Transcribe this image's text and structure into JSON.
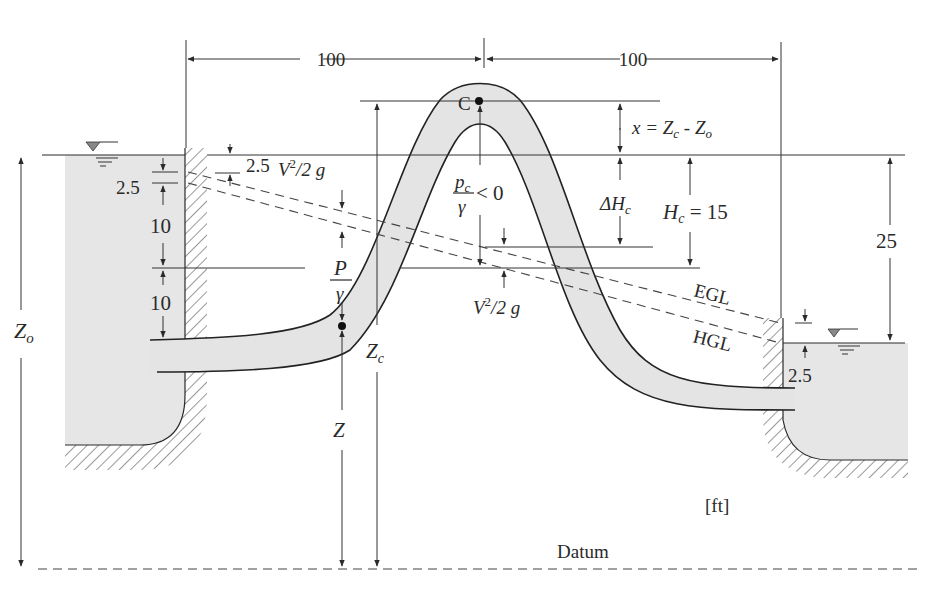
{
  "diagram": {
    "units": "[ft]",
    "datum_label": "Datum",
    "horizontal_dims": {
      "left_span": "100",
      "right_span": "100"
    },
    "crest": {
      "point_label": "C",
      "x_eq_lhs": "x = Z",
      "x_eq_sub1": "c",
      "x_eq_mid": " - Z",
      "x_eq_sub2": "o",
      "pressure_num": "p",
      "pressure_num_sub": "c",
      "pressure_den": "γ",
      "pressure_cond": "< 0",
      "delta_h": "ΔH",
      "delta_h_sub": "c",
      "hc": "H",
      "hc_sub": "c",
      "hc_value": " = 15"
    },
    "left_reservoir": {
      "entrance_loss": "2.5",
      "upper_10": "10",
      "lower_10": "10",
      "zo": "Z",
      "zo_sub": "o",
      "wall_loss": "2.5"
    },
    "left_point": {
      "velocity_head_v": "V",
      "velocity_head_sup": "2",
      "velocity_head_rest": "/2 g",
      "pressure_num": "P",
      "pressure_den": "γ",
      "z": "Z",
      "zc": "Z",
      "zc_sub": "c"
    },
    "crest_velocity": {
      "v": "V",
      "sup": "2",
      "rest": "/2 g"
    },
    "right_reservoir": {
      "elevation_diff": "25",
      "exit_loss": "2.5"
    },
    "lines": {
      "egl": "EGL",
      "hgl": "HGL"
    },
    "colors": {
      "water": "#e6e6e6",
      "line": "#2a2a2a"
    }
  }
}
